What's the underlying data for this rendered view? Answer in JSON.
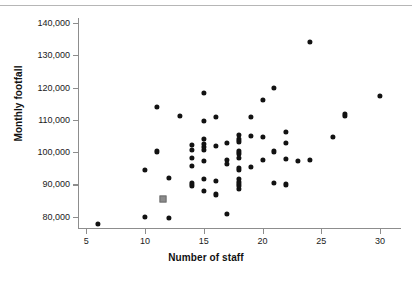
{
  "chart_data": {
    "type": "scatter",
    "title": "",
    "xlabel": "Number of staff",
    "ylabel": "Monthly footfall",
    "xlim": [
      4.3,
      31.7
    ],
    "ylim": [
      76500,
      141500
    ],
    "xticks": [
      5,
      10,
      15,
      20,
      25,
      30
    ],
    "xtick_labels": [
      "5",
      "10",
      "15",
      "20",
      "25",
      "30"
    ],
    "yticks": [
      80000,
      90000,
      100000,
      110000,
      120000,
      130000,
      140000
    ],
    "ytick_labels": [
      "80,000",
      "90,000",
      "100,000",
      "110,000",
      "120,000",
      "130,000",
      "140,000"
    ],
    "grid": false,
    "legend": null,
    "marker_color": "#121212",
    "highlight_marker_color": "#8b8b8b",
    "series": [
      {
        "name": "Stores",
        "marker": "circle",
        "points": [
          [
            6,
            77800
          ],
          [
            10,
            79800
          ],
          [
            10,
            94500
          ],
          [
            11,
            100200
          ],
          [
            11,
            114000
          ],
          [
            12,
            79600
          ],
          [
            12,
            92000
          ],
          [
            13,
            111100
          ],
          [
            14,
            89700
          ],
          [
            14,
            90500
          ],
          [
            14,
            95800
          ],
          [
            14,
            98200
          ],
          [
            14,
            100800
          ],
          [
            14,
            102200
          ],
          [
            15,
            88000
          ],
          [
            15,
            91800
          ],
          [
            15,
            97200
          ],
          [
            15,
            100600
          ],
          [
            15,
            101600
          ],
          [
            15,
            102500
          ],
          [
            15,
            104000
          ],
          [
            15,
            109700
          ],
          [
            15,
            118400
          ],
          [
            16,
            86900
          ],
          [
            16,
            91100
          ],
          [
            16,
            102000
          ],
          [
            16,
            111000
          ],
          [
            17,
            80800
          ],
          [
            17,
            96400
          ],
          [
            17,
            97700
          ],
          [
            17,
            102800
          ],
          [
            18,
            88600
          ],
          [
            18,
            89700
          ],
          [
            18,
            90600
          ],
          [
            18,
            91600
          ],
          [
            18,
            94600
          ],
          [
            18,
            95000
          ],
          [
            18,
            98300
          ],
          [
            18,
            99600
          ],
          [
            18,
            100500
          ],
          [
            18,
            103300
          ],
          [
            18,
            104200
          ],
          [
            18,
            105200
          ],
          [
            19,
            95400
          ],
          [
            19,
            105000
          ],
          [
            19,
            110900
          ],
          [
            20,
            97700
          ],
          [
            20,
            104700
          ],
          [
            20,
            116200
          ],
          [
            21,
            90400
          ],
          [
            21,
            100200
          ],
          [
            21,
            119800
          ],
          [
            22,
            90000
          ],
          [
            22,
            97900
          ],
          [
            22,
            102800
          ],
          [
            22,
            106200
          ],
          [
            23,
            97300
          ],
          [
            24,
            97700
          ],
          [
            24,
            134000
          ],
          [
            26,
            104800
          ],
          [
            27,
            111100
          ],
          [
            27,
            111900
          ],
          [
            30,
            117500
          ]
        ]
      },
      {
        "name": "Highlighted store",
        "marker": "square",
        "points": [
          [
            11.5,
            85500
          ]
        ]
      }
    ]
  }
}
